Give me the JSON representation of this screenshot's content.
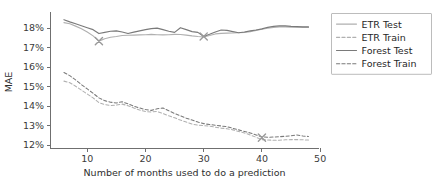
{
  "chart_data": {
    "type": "line",
    "title": "",
    "xlabel": "Number of months used to do a prediction",
    "ylabel": "MAE",
    "xlim": [
      3.6,
      49.8
    ],
    "ylim": [
      11.85,
      18.62
    ],
    "xticks": [
      10,
      20,
      30,
      40,
      50
    ],
    "xticklabels": [
      "10",
      "20",
      "30",
      "40",
      "50"
    ],
    "yticks": [
      12,
      13,
      14,
      15,
      16,
      17,
      18
    ],
    "yticklabels": [
      "12%",
      "13%",
      "14%",
      "15%",
      "16%",
      "17%",
      "18%"
    ],
    "grid": false,
    "legend_position": "upper right",
    "colors": {
      "etr": "#b0b0b0",
      "forest": "#7a7a7a",
      "marker": "#9a9a9a",
      "axis": "#6f6f6f",
      "text": "#2e2e2e"
    },
    "x": [
      6,
      7,
      8,
      9,
      10,
      11,
      12,
      13,
      14,
      15,
      16,
      17,
      18,
      19,
      20,
      21,
      22,
      23,
      24,
      25,
      26,
      27,
      28,
      29,
      30,
      31,
      32,
      33,
      34,
      35,
      36,
      37,
      38,
      39,
      40,
      41,
      42,
      43,
      44,
      45,
      46,
      47,
      48
    ],
    "series": [
      {
        "name": "ETR Test",
        "style": "solid",
        "color": "#b0b0b0",
        "values": [
          18.28,
          18.22,
          18.1,
          17.97,
          17.8,
          17.6,
          17.33,
          17.45,
          17.53,
          17.57,
          17.62,
          17.63,
          17.64,
          17.65,
          17.66,
          17.68,
          17.66,
          17.65,
          17.66,
          17.68,
          17.67,
          17.64,
          17.6,
          17.57,
          17.55,
          17.62,
          17.7,
          17.73,
          17.74,
          17.75,
          17.76,
          17.78,
          17.82,
          17.88,
          17.94,
          17.99,
          18.03,
          18.06,
          18.06,
          18.05,
          18.04,
          18.04,
          18.04
        ]
      },
      {
        "name": "ETR Train",
        "style": "dashed",
        "color": "#b0b0b0",
        "values": [
          15.28,
          15.2,
          15.02,
          14.82,
          14.62,
          14.42,
          14.18,
          14.08,
          14.03,
          14.05,
          14.1,
          14.02,
          13.9,
          13.8,
          13.72,
          13.7,
          13.72,
          13.62,
          13.5,
          13.4,
          13.28,
          13.18,
          13.08,
          13.02,
          13.0,
          12.97,
          12.92,
          12.87,
          12.84,
          12.78,
          12.7,
          12.62,
          12.52,
          12.4,
          12.28,
          12.26,
          12.25,
          12.25,
          12.27,
          12.28,
          12.28,
          12.27,
          12.26
        ]
      },
      {
        "name": "Forest Test",
        "style": "solid",
        "color": "#7a7a7a",
        "values": [
          18.43,
          18.32,
          18.22,
          18.12,
          18.02,
          17.92,
          17.72,
          17.78,
          17.84,
          17.86,
          17.8,
          17.72,
          17.79,
          17.86,
          17.92,
          17.97,
          18.0,
          17.92,
          17.84,
          17.78,
          18.02,
          17.92,
          17.82,
          17.78,
          17.57,
          17.68,
          17.8,
          17.9,
          17.88,
          17.82,
          17.76,
          17.8,
          17.86,
          17.9,
          17.96,
          18.04,
          18.09,
          18.11,
          18.11,
          18.09,
          18.08,
          18.06,
          18.06
        ]
      },
      {
        "name": "Forest Train",
        "style": "dashed",
        "color": "#7a7a7a",
        "values": [
          15.72,
          15.56,
          15.34,
          15.1,
          14.88,
          14.66,
          14.42,
          14.28,
          14.2,
          14.16,
          14.22,
          14.12,
          14.0,
          13.9,
          13.82,
          13.78,
          13.86,
          13.9,
          13.76,
          13.62,
          13.5,
          13.38,
          13.28,
          13.18,
          13.1,
          13.05,
          13.02,
          12.98,
          12.94,
          12.86,
          12.78,
          12.7,
          12.62,
          12.52,
          12.42,
          12.4,
          12.41,
          12.43,
          12.45,
          12.48,
          12.52,
          12.47,
          12.44
        ]
      }
    ],
    "markers": [
      {
        "name": "etr-test-best",
        "x": 12,
        "y": 17.33,
        "symbol": "x",
        "color": "#9a9a9a"
      },
      {
        "name": "forest-test-best",
        "x": 30,
        "y": 17.57,
        "symbol": "x",
        "color": "#9a9a9a"
      },
      {
        "name": "train-best",
        "x": 40,
        "y": 12.38,
        "symbol": "x",
        "color": "#9a9a9a"
      }
    ],
    "legend": [
      {
        "label": "ETR Test",
        "style": "solid",
        "color": "#b0b0b0"
      },
      {
        "label": "ETR Train",
        "style": "dashed",
        "color": "#b0b0b0"
      },
      {
        "label": "Forest Test",
        "style": "solid",
        "color": "#7a7a7a"
      },
      {
        "label": "Forest Train",
        "style": "dashed",
        "color": "#7a7a7a"
      }
    ]
  }
}
